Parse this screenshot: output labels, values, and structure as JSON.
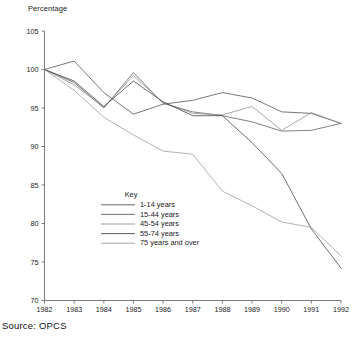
{
  "axis_label_y": "Percentage",
  "source_note": "Source:  OPCS",
  "key_title": "Key",
  "colors": {
    "axis": "#6e6e6e",
    "text": "#1a1a1a",
    "series_1_14": "#4a4a4a",
    "series_15_44": "#555555",
    "series_45_54": "#8c8c8c",
    "series_55_74": "#3c3c3c",
    "series_75_over": "#9a9a9a",
    "background": "#ffffff"
  },
  "y_ticks": [
    "70",
    "75",
    "80",
    "85",
    "90",
    "95",
    "100",
    "105"
  ],
  "x_ticks": [
    "1982",
    "1983",
    "1984",
    "1985",
    "1986",
    "1987",
    "1988",
    "1989",
    "1990",
    "1991",
    "1992"
  ],
  "chart_data": {
    "type": "line",
    "title": "",
    "subtitle": "",
    "xlabel": "",
    "ylabel": "Percentage",
    "xlim": [
      1982,
      1992
    ],
    "ylim": [
      70,
      105
    ],
    "y_tick_step": 5,
    "grid": false,
    "legend_position": "inside-lower-left",
    "legend_title": "Key",
    "annotations": [
      "Source:  OPCS"
    ],
    "categories": [
      1982,
      1983,
      1984,
      1985,
      1986,
      1987,
      1988,
      1989,
      1990,
      1991,
      1992
    ],
    "series": [
      {
        "name": "1-14 years",
        "color": "#4a4a4a",
        "values": [
          100.0,
          101.1,
          97.0,
          94.2,
          95.5,
          96.0,
          97.0,
          96.3,
          94.5,
          94.3,
          93.0
        ]
      },
      {
        "name": "15-44 years",
        "color": "#555555",
        "values": [
          100.0,
          98.3,
          95.0,
          99.6,
          95.6,
          94.5,
          94.0,
          93.2,
          92.0,
          92.1,
          93.0
        ]
      },
      {
        "name": "45-54 years",
        "color": "#8c8c8c",
        "values": [
          100.0,
          98.0,
          95.1,
          99.2,
          95.7,
          94.3,
          94.1,
          95.2,
          92.1,
          94.4,
          93.0
        ]
      },
      {
        "name": "55-74 years",
        "color": "#3c3c3c",
        "values": [
          100.0,
          98.5,
          95.2,
          98.5,
          95.8,
          94.0,
          94.0,
          90.5,
          86.5,
          79.3,
          74.2
        ]
      },
      {
        "name": "75 years and over",
        "color": "#9a9a9a",
        "values": [
          100.0,
          97.3,
          93.8,
          91.5,
          89.4,
          89.0,
          84.2,
          82.3,
          80.2,
          79.5,
          75.8
        ]
      }
    ]
  }
}
